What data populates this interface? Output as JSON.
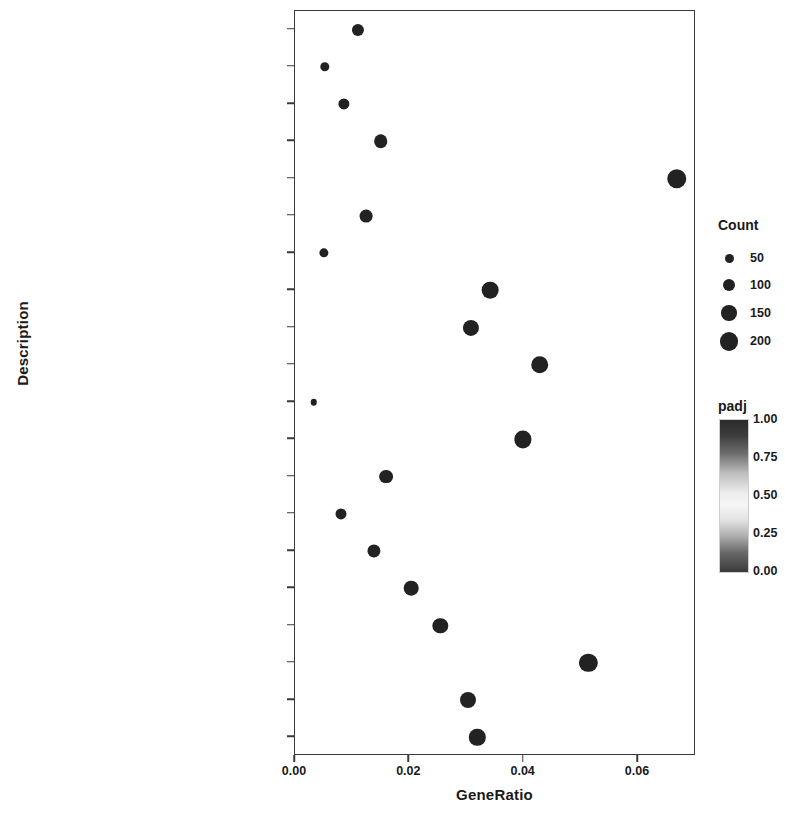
{
  "chart_data": {
    "type": "scatter",
    "title": "",
    "xlabel": "GeneRatio",
    "ylabel": "Description",
    "xlim": [
      0.0,
      0.07
    ],
    "xticks": [
      0.0,
      0.02,
      0.04,
      0.06
    ],
    "xtick_labels": [
      "0.00",
      "0.02",
      "0.04",
      "0.06"
    ],
    "grid": false,
    "legend_position": "right",
    "categories": [
      "Pertussis",
      "Fatty acid degradation",
      "Malaria",
      "Staphylococcus aureus infection",
      "Alzheimer disease",
      "Peroxisome",
      "Pyruvate metabolism",
      "Phagosome",
      "Tuberculosis",
      "Thermogenesis",
      "Citrate cycle (TCA cycle)",
      "Cytokine-cytokine receptor interaction",
      "ECM-receptor interaction",
      "Valine, leucine and isoleucine degradation",
      "Complement and coagulation cascades",
      "Hematopoietic cell lineage",
      "Carbon metabolism",
      "Parkinson disease",
      "Non-alcoholic fatty liver disease (NAFLD)",
      "Oxidative phosphorylation"
    ],
    "points": [
      {
        "description": "Pertussis",
        "gene_ratio": 0.011,
        "count": 55,
        "padj": 0.02
      },
      {
        "description": "Fatty acid degradation",
        "gene_ratio": 0.0052,
        "count": 28,
        "padj": 0.02
      },
      {
        "description": "Malaria",
        "gene_ratio": 0.0086,
        "count": 44,
        "padj": 0.02
      },
      {
        "description": "Staphylococcus aureus infection",
        "gene_ratio": 0.015,
        "count": 76,
        "padj": 0.02
      },
      {
        "description": "Alzheimer disease",
        "gene_ratio": 0.0668,
        "count": 215,
        "padj": 0.01
      },
      {
        "description": "Peroxisome",
        "gene_ratio": 0.0124,
        "count": 64,
        "padj": 0.02
      },
      {
        "description": "Pyruvate metabolism",
        "gene_ratio": 0.005,
        "count": 27,
        "padj": 0.02
      },
      {
        "description": "Phagosome",
        "gene_ratio": 0.0341,
        "count": 140,
        "padj": 0.01
      },
      {
        "description": "Tuberculosis",
        "gene_ratio": 0.0308,
        "count": 126,
        "padj": 0.01
      },
      {
        "description": "Thermogenesis",
        "gene_ratio": 0.0428,
        "count": 160,
        "padj": 0.01
      },
      {
        "description": "Citrate cycle (TCA cycle)",
        "gene_ratio": 0.0033,
        "count": 18,
        "padj": 0.02
      },
      {
        "description": "Cytokine-cytokine receptor interaction",
        "gene_ratio": 0.0399,
        "count": 152,
        "padj": 0.01
      },
      {
        "description": "ECM-receptor interaction",
        "gene_ratio": 0.0159,
        "count": 80,
        "padj": 0.02
      },
      {
        "description": "Valine, leucine and isoleucine degradation",
        "gene_ratio": 0.0081,
        "count": 42,
        "padj": 0.02
      },
      {
        "description": "Complement and coagulation cascades",
        "gene_ratio": 0.0138,
        "count": 70,
        "padj": 0.02
      },
      {
        "description": "Hematopoietic cell lineage",
        "gene_ratio": 0.0203,
        "count": 95,
        "padj": 0.02
      },
      {
        "description": "Carbon metabolism",
        "gene_ratio": 0.0254,
        "count": 110,
        "padj": 0.01
      },
      {
        "description": "Parkinson disease",
        "gene_ratio": 0.0513,
        "count": 180,
        "padj": 0.01
      },
      {
        "description": "Non-alcoholic fatty liver disease (NAFLD)",
        "gene_ratio": 0.0303,
        "count": 124,
        "padj": 0.01
      },
      {
        "description": "Oxidative phosphorylation",
        "gene_ratio": 0.0319,
        "count": 132,
        "padj": 0.01
      }
    ],
    "legends": {
      "count": {
        "title": "Count",
        "values": [
          50,
          100,
          150,
          200
        ],
        "labels": [
          "50",
          "100",
          "150",
          "200"
        ]
      },
      "padj": {
        "title": "padj",
        "ticks": [
          1.0,
          0.75,
          0.5,
          0.25,
          0.0
        ],
        "tick_labels": [
          "1.00",
          "0.75",
          "0.50",
          "0.25",
          "0.00"
        ],
        "range": [
          0.0,
          1.0
        ]
      }
    },
    "colors": {
      "dot": "#222222",
      "axis": "#3a3a3a",
      "text": "#1a1a1a",
      "background": "#ffffff"
    }
  }
}
